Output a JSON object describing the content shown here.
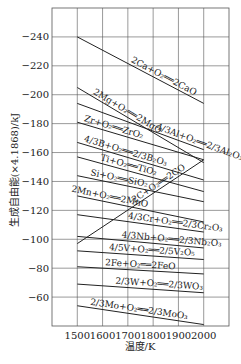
{
  "chart_data": {
    "type": "line",
    "title": "",
    "xlabel": "温度/K",
    "ylabel": "生成自由能(×4.1868)/kJ",
    "xlim": [
      1400,
      2100
    ],
    "ylim": [
      -260,
      -40
    ],
    "x_ticks": [
      1500,
      1600,
      1700,
      1800,
      1900,
      2000
    ],
    "y_ticks": [
      -240,
      -220,
      -200,
      -180,
      -160,
      -140,
      -120,
      -100,
      -80,
      -60
    ],
    "y_tick_labels": [
      "-240",
      "-220",
      "-200",
      "-180",
      "-160",
      "-140",
      "-120",
      "-100",
      "-80",
      "-60"
    ],
    "x_tick_labels": [
      "1500",
      "1600",
      "1700",
      "1800",
      "1900",
      "2000"
    ],
    "grid": true,
    "legend": "inline labels",
    "x": [
      1500,
      2000
    ],
    "series": [
      {
        "name": "2Ca+O2=2CaO",
        "label": "2Ca+O₂══2CaO",
        "values": [
          -240,
          -194
        ]
      },
      {
        "name": "2Mg+O2=2MgO",
        "label": "2Mg+O₂══2MgO",
        "values": [
          -205,
          -153
        ]
      },
      {
        "name": "4/3Al+O2=2/3Al2O3",
        "label": "4/3Al+O₂══2/3Al₂O₃",
        "values": [
          -194,
          -162
        ]
      },
      {
        "name": "Zr+O2=ZrO2",
        "label": "Zr+O₂══ZrO₂",
        "values": [
          -181,
          -155
        ]
      },
      {
        "name": "4/3B+O2=2/3B2O3",
        "label": "4/3B+O₂══2/3B₂O₃",
        "values": [
          -167,
          -141
        ]
      },
      {
        "name": "Ti+O2=TiO2",
        "label": "Ti+O₂══TiO₂",
        "values": [
          -157,
          -133
        ]
      },
      {
        "name": "Si+O2=SiO2",
        "label": "Si+O₂══SiO₂",
        "values": [
          -144,
          -126
        ]
      },
      {
        "name": "2Mn+O2=2MnO",
        "label": "2Mn+O₂══2MnO",
        "values": [
          -130,
          -112
        ]
      },
      {
        "name": "2C+O2=2CO",
        "label": "2C+O₂══2CO",
        "values": [
          -97,
          -155
        ]
      },
      {
        "name": "4/3Cr+O2=2/3Cr2O3",
        "label": "4/3Cr+O₂══2/3Cr₂O₃",
        "values": [
          -117,
          -105
        ]
      },
      {
        "name": "4/3Nb+O2=2/3Nb2O3",
        "label": "4/3Nb+O₂══2/3Nb₂O₃",
        "values": [
          -102,
          -94
        ]
      },
      {
        "name": "4/5V+O2=2/5V2O5",
        "label": "4/5V+O₂══2/5V₂O₅",
        "values": [
          -92,
          -86
        ]
      },
      {
        "name": "2Fe+O2=2FeO",
        "label": "2Fe+O₂══2FeO",
        "values": [
          -81,
          -76
        ]
      },
      {
        "name": "2/3W+O2=2/3WO3",
        "label": "2/3W+O₂══2/3WO₃",
        "values": [
          -69,
          -63
        ]
      },
      {
        "name": "2/3Mo+O2=2/3MoO3",
        "label": "2/3Mo+O₂══2/3MoO₃",
        "values": [
          -54,
          -41
        ]
      }
    ]
  },
  "colors": {
    "line": "#222222",
    "grid": "#555555",
    "background": "#ffffff"
  }
}
